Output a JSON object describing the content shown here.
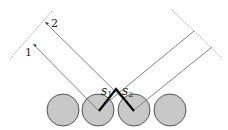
{
  "diagram": {
    "labels": {
      "ray1": "1",
      "ray2": "2",
      "s1_base": "s",
      "s1_sub": "1",
      "s2_base": "s",
      "s2_sub": "2"
    },
    "colors": {
      "circle_fill": "#c8c8c8",
      "circle_stroke": "#555555",
      "ray_line": "#808080",
      "path_line": "#000000",
      "dotted_line": "#999999",
      "arrow": "#2a3a6a"
    },
    "circles": [
      {
        "cx": 63,
        "cy": 110,
        "r": 16
      },
      {
        "cx": 98,
        "cy": 110,
        "r": 16
      },
      {
        "cx": 134,
        "cy": 110,
        "r": 16
      },
      {
        "cx": 170,
        "cy": 110,
        "r": 16
      }
    ]
  }
}
